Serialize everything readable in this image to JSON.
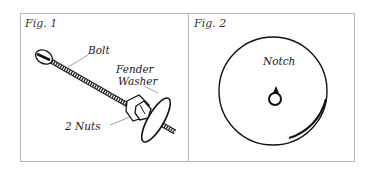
{
  "figures": [
    {
      "label": "Fig. 1",
      "callouts": {
        "bolt": "Bolt",
        "fender_washer_line1": "Fender",
        "fender_washer_line2": "Washer",
        "nuts": "2 Nuts"
      }
    },
    {
      "label": "Fig. 2",
      "callouts": {
        "notch": "Notch"
      }
    }
  ]
}
